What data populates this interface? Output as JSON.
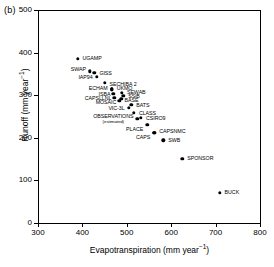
{
  "panel": {
    "label": "(b)"
  },
  "axes": {
    "x": {
      "title": "Evapotranspiration (mm year",
      "title_sup": "−1",
      "title_tail": ")",
      "ticks": [
        300,
        400,
        500,
        600,
        700,
        800
      ],
      "min": 300,
      "max": 800
    },
    "y": {
      "title": "Runoff (mm year",
      "title_sup": "−1",
      "title_tail": ")",
      "ticks": [
        0,
        100,
        200,
        300,
        400,
        500
      ],
      "min": 0,
      "max": 500
    }
  },
  "chart_data": {
    "type": "scatter",
    "title": "",
    "xlabel": "Evapotranspiration (mm year−1)",
    "ylabel": "Runoff (mm year−1)",
    "xlim": [
      300,
      800
    ],
    "ylim": [
      0,
      500
    ],
    "xticks": [
      300,
      400,
      500,
      600,
      700,
      800
    ],
    "yticks": [
      0,
      100,
      200,
      300,
      400,
      500
    ],
    "grid": false,
    "legend": null,
    "annotations": [
      "(b)",
      "(estimated)"
    ],
    "points": [
      {
        "label": "UGAMP",
        "x": 389,
        "y": 385,
        "label_pos": "right",
        "dx": 5,
        "dy": 0
      },
      {
        "label": "SWAP",
        "x": 417,
        "y": 356,
        "label_pos": "left",
        "dx": -4,
        "dy": -1
      },
      {
        "label": "GISS",
        "x": 427,
        "y": 353,
        "label_pos": "right",
        "dx": 5,
        "dy": 1
      },
      {
        "label": "IAP94",
        "x": 432,
        "y": 343,
        "label_pos": "left",
        "dx": -4,
        "dy": 1
      },
      {
        "label": "SECHIBA 2",
        "x": 450,
        "y": 329,
        "label_pos": "right",
        "dx": 5,
        "dy": 2
      },
      {
        "label": "ECHAM",
        "x": 466,
        "y": 314,
        "label_pos": "left",
        "dx": -4,
        "dy": 0
      },
      {
        "label": "UKMO",
        "x": 466,
        "y": 314,
        "label_pos": "right",
        "dx": 5,
        "dy": 0
      },
      {
        "label": "SEWAB",
        "x": 489,
        "y": 306,
        "label_pos": "right",
        "dx": 5,
        "dy": 0
      },
      {
        "label": "ISBA",
        "x": 470,
        "y": 303,
        "label_pos": "left",
        "dx": -3,
        "dy": 1
      },
      {
        "label": "SSiB",
        "x": 492,
        "y": 298,
        "label_pos": "right",
        "dx": 5,
        "dy": 1
      },
      {
        "label": "CAPSLLNL",
        "x": 472,
        "y": 294,
        "label_pos": "left",
        "dx": -3,
        "dy": 1
      },
      {
        "label": "BASE",
        "x": 488,
        "y": 291,
        "label_pos": "right",
        "dx": 3,
        "dy": 2
      },
      {
        "label": "MOSAIC",
        "x": 483,
        "y": 287,
        "label_pos": "left",
        "dx": -3,
        "dy": 2
      },
      {
        "label": "BATS",
        "x": 510,
        "y": 277,
        "label_pos": "right",
        "dx": 5,
        "dy": 1
      },
      {
        "label": "VIC-3L",
        "x": 504,
        "y": 270,
        "label_pos": "left",
        "dx": -4,
        "dy": 1
      },
      {
        "label": "CLASS",
        "x": 516,
        "y": 259,
        "label_pos": "right",
        "dx": 5,
        "dy": 1
      },
      {
        "label": "CSIRO9",
        "x": 532,
        "y": 247,
        "label_pos": "right",
        "dx": 5,
        "dy": 1
      },
      {
        "label": "OBSERVATIONS",
        "x": 524,
        "y": 244,
        "label_pos": "left",
        "dx": -4,
        "dy": 0,
        "note": "(estimated)"
      },
      {
        "label": "PLACE",
        "x": 546,
        "y": 231,
        "label_pos": "left",
        "dx": -4,
        "dy": 5
      },
      {
        "label": "CAPSNMC",
        "x": 562,
        "y": 212,
        "label_pos": "right",
        "dx": 5,
        "dy": -1
      },
      {
        "label": "CAPS",
        "x": 562,
        "y": 212,
        "label_pos": "left",
        "dx": -4,
        "dy": 5
      },
      {
        "label": "SWB",
        "x": 582,
        "y": 194,
        "label_pos": "right",
        "dx": 5,
        "dy": 1
      },
      {
        "label": "SPONSOR",
        "x": 625,
        "y": 151,
        "label_pos": "right",
        "dx": 5,
        "dy": 0
      },
      {
        "label": "BUCK",
        "x": 709,
        "y": 71,
        "label_pos": "right",
        "dx": 5,
        "dy": 0
      }
    ]
  }
}
